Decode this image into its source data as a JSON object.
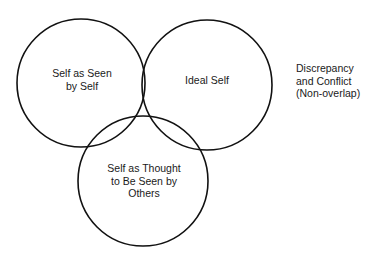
{
  "diagram": {
    "type": "venn",
    "stroke_color": "#111111",
    "circles": [
      {
        "id": "self-as-seen-by-self",
        "cx": 81,
        "cy": 83,
        "r": 64,
        "label_lines": [
          "Self as Seen",
          "by Self"
        ]
      },
      {
        "id": "ideal-self",
        "cx": 207,
        "cy": 85,
        "r": 65,
        "label_lines": [
          "Ideal Self"
        ]
      },
      {
        "id": "self-as-thought-seen-by-others",
        "cx": 143,
        "cy": 181,
        "r": 65,
        "label_lines": [
          "Self as Thought",
          "to Be Seen by",
          "Others"
        ]
      }
    ],
    "annotation": {
      "lines": [
        "Discrepancy",
        "and Conflict",
        "(Non-overlap)"
      ]
    }
  }
}
